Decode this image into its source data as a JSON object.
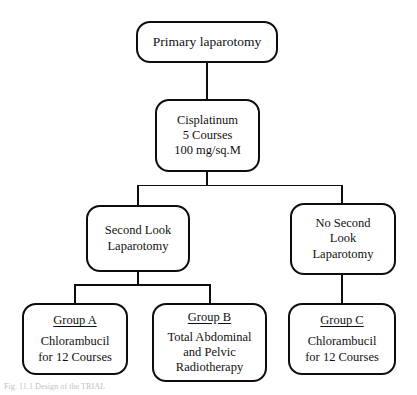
{
  "figure": {
    "type": "flowchart",
    "orientation": "top-down",
    "background_color": "#ffffff",
    "line_color": "#0d0d0d",
    "text_color": "#111111",
    "caption": "Fig. 11.1  Design of the TRIAL"
  },
  "nodes": {
    "primary": {
      "id": "primary-laparotomy",
      "lines": [
        "Primary laparotomy"
      ]
    },
    "cisplatinum": {
      "id": "cisplatinum",
      "lines": [
        "Cisplatinum",
        "5 Courses",
        "100 mg/sq.M"
      ]
    },
    "second_look": {
      "id": "second-look-laparotomy",
      "lines": [
        "Second Look",
        "Laparotomy"
      ]
    },
    "no_second_look": {
      "id": "no-second-look-laparotomy",
      "lines": [
        "No Second",
        "Look",
        "Laparotomy"
      ]
    },
    "group_a": {
      "id": "group-a",
      "heading": "Group A",
      "lines": [
        "Chlorambucil",
        "for 12 Courses"
      ]
    },
    "group_b": {
      "id": "group-b",
      "heading": "Group B",
      "lines": [
        "Total Abdominal",
        "and Pelvic",
        "Radiotherapy"
      ]
    },
    "group_c": {
      "id": "group-c",
      "heading": "Group C",
      "lines": [
        "Chlorambucil",
        "for 12 Courses"
      ]
    }
  },
  "edges": [
    {
      "from": "primary-laparotomy",
      "to": "cisplatinum"
    },
    {
      "from": "cisplatinum",
      "to": "second-look-laparotomy"
    },
    {
      "from": "cisplatinum",
      "to": "no-second-look-laparotomy"
    },
    {
      "from": "second-look-laparotomy",
      "to": "group-a"
    },
    {
      "from": "second-look-laparotomy",
      "to": "group-b"
    },
    {
      "from": "no-second-look-laparotomy",
      "to": "group-c"
    }
  ]
}
